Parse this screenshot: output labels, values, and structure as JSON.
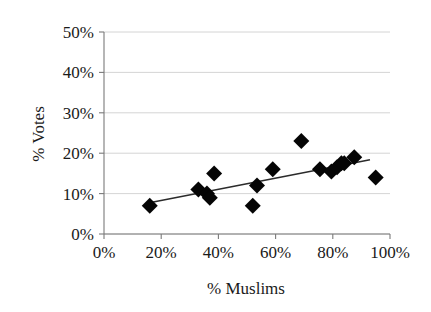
{
  "chart_data": {
    "type": "scatter",
    "title": "",
    "xlabel": "% Muslims",
    "ylabel": "% Votes",
    "xlim": [
      0,
      100
    ],
    "ylim": [
      0,
      50
    ],
    "xticks": [
      0,
      20,
      40,
      60,
      80,
      100
    ],
    "yticks": [
      0,
      10,
      20,
      30,
      40,
      50
    ],
    "xtick_labels": [
      "0%",
      "20%",
      "40%",
      "60%",
      "80%",
      "100%"
    ],
    "ytick_labels": [
      "0%",
      "10%",
      "20%",
      "30%",
      "40%",
      "50%"
    ],
    "grid": "horizontal",
    "legend": "none",
    "marker_shape": "diamond",
    "marker_color": "#050505",
    "trendline_color": "#2b2b2b",
    "gridline_color": "#c9c9c9",
    "axis_color": "#7a7a7a",
    "points": [
      {
        "x": 16,
        "y": 7
      },
      {
        "x": 33,
        "y": 11
      },
      {
        "x": 36,
        "y": 10
      },
      {
        "x": 37,
        "y": 9
      },
      {
        "x": 38.5,
        "y": 15
      },
      {
        "x": 52,
        "y": 7
      },
      {
        "x": 53.5,
        "y": 12
      },
      {
        "x": 59,
        "y": 16
      },
      {
        "x": 69,
        "y": 23
      },
      {
        "x": 75.5,
        "y": 16
      },
      {
        "x": 79.5,
        "y": 15.5
      },
      {
        "x": 81.5,
        "y": 16.5
      },
      {
        "x": 83,
        "y": 17.5
      },
      {
        "x": 84,
        "y": 17.5
      },
      {
        "x": 87.5,
        "y": 19
      },
      {
        "x": 95,
        "y": 14
      }
    ],
    "trendline": {
      "x_start": 15,
      "y_start": 7.6,
      "x_end": 93,
      "y_end": 18.4
    }
  }
}
